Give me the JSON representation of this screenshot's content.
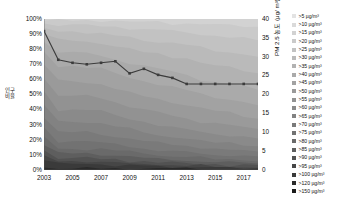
{
  "chart_data": {
    "type": "area",
    "title": "",
    "subtitle": "",
    "xlabel": "",
    "ylabel": "인구 비율",
    "ylabel_right": "PM 2.5 농도 (μg/ m³)",
    "x": [
      2003,
      2004,
      2005,
      2006,
      2007,
      2008,
      2009,
      2010,
      2011,
      2012,
      2013,
      2014,
      2015,
      2016,
      2017,
      2018
    ],
    "xlim": [
      2003,
      2018
    ],
    "ylim": [
      0,
      100
    ],
    "ylim_right": [
      0,
      40
    ],
    "yticks": [
      "0%",
      "10%",
      "20%",
      "30%",
      "40%",
      "50%",
      "60%",
      "70%",
      "80%",
      "90%",
      "100%"
    ],
    "ytick_values": [
      0,
      10,
      20,
      30,
      40,
      50,
      60,
      70,
      80,
      90,
      100
    ],
    "yticks_right": [
      "0",
      "5",
      "10",
      "15",
      "20",
      "25",
      "30",
      "35",
      "40"
    ],
    "ytick_values_right": [
      0,
      5,
      10,
      15,
      20,
      25,
      30,
      35,
      40
    ],
    "xticks": [
      "2003",
      "2005",
      "2007",
      "2009",
      "2011",
      "2013",
      "2015",
      "2017"
    ],
    "xtick_values": [
      2003,
      2005,
      2007,
      2009,
      2011,
      2013,
      2015,
      2017
    ],
    "grid": false,
    "legend_position": "right",
    "legend_title": "PM 2.5 농도 (μg/ m³)",
    "series": [
      {
        "name": ">5 µg/m³",
        "color": "#e3e3e3",
        "values": [
          100,
          100,
          100,
          100,
          100,
          100,
          100,
          100,
          100,
          100,
          100,
          100,
          100,
          100,
          100,
          100
        ]
      },
      {
        "name": ">10 µg/m³",
        "color": "#dadada",
        "values": [
          100,
          100,
          100,
          100,
          100,
          100,
          100,
          100,
          100,
          100,
          100,
          100,
          100,
          100,
          100,
          100
        ]
      },
      {
        "name": ">15 µg/m³",
        "color": "#d2d2d2",
        "values": [
          100,
          100,
          100,
          100,
          100,
          100,
          100,
          100,
          100,
          100,
          100,
          100,
          100,
          100,
          100,
          100
        ]
      },
      {
        "name": ">20 µg/m³",
        "color": "#cacaca",
        "values": [
          99,
          99,
          99,
          99,
          99,
          99,
          98,
          98,
          98,
          97,
          97,
          97,
          96,
          96,
          95,
          95
        ]
      },
      {
        "name": ">25 µg/m³",
        "color": "#c2c2c2",
        "values": [
          97,
          96,
          96,
          96,
          95,
          95,
          94,
          93,
          93,
          92,
          91,
          90,
          89,
          88,
          87,
          86
        ]
      },
      {
        "name": ">30 µg/m³",
        "color": "#bababa",
        "values": [
          94,
          92,
          92,
          91,
          90,
          89,
          88,
          86,
          85,
          84,
          83,
          81,
          79,
          78,
          77,
          75
        ]
      },
      {
        "name": ">35 µg/m³",
        "color": "#b2b2b2",
        "values": [
          90,
          86,
          86,
          85,
          84,
          82,
          80,
          78,
          77,
          75,
          74,
          71,
          69,
          68,
          66,
          64
        ]
      },
      {
        "name": ">40 µg/m³",
        "color": "#aaaaaa",
        "values": [
          85,
          78,
          78,
          77,
          76,
          73,
          71,
          69,
          67,
          65,
          63,
          60,
          58,
          57,
          55,
          53
        ]
      },
      {
        "name": ">45 µg/m³",
        "color": "#a2a2a2",
        "values": [
          78,
          69,
          69,
          68,
          67,
          64,
          61,
          59,
          57,
          55,
          53,
          50,
          48,
          47,
          45,
          43
        ]
      },
      {
        "name": ">50 µg/m³",
        "color": "#9a9a9a",
        "values": [
          70,
          59,
          59,
          58,
          57,
          54,
          51,
          49,
          47,
          45,
          43,
          41,
          39,
          38,
          36,
          34
        ]
      },
      {
        "name": ">55 µg/m³",
        "color": "#929292",
        "values": [
          61,
          49,
          49,
          49,
          48,
          45,
          42,
          40,
          38,
          36,
          34,
          32,
          31,
          30,
          28,
          27
        ]
      },
      {
        "name": ">60 µg/m³",
        "color": "#8a8a8a",
        "values": [
          52,
          40,
          40,
          40,
          39,
          36,
          34,
          32,
          30,
          28,
          27,
          25,
          24,
          23,
          22,
          21
        ]
      },
      {
        "name": ">65 µg/m³",
        "color": "#828282",
        "values": [
          43,
          32,
          32,
          32,
          31,
          29,
          27,
          25,
          23,
          22,
          21,
          19,
          18,
          18,
          17,
          16
        ]
      },
      {
        "name": ">70 µg/m³",
        "color": "#7a7a7a",
        "values": [
          35,
          25,
          25,
          25,
          24,
          22,
          21,
          19,
          18,
          17,
          16,
          15,
          14,
          13,
          13,
          12
        ]
      },
      {
        "name": ">75 µg/m³",
        "color": "#727272",
        "values": [
          28,
          19,
          19,
          19,
          18,
          17,
          16,
          14,
          13,
          12,
          12,
          11,
          10,
          10,
          9,
          9
        ]
      },
      {
        "name": ">80 µg/m³",
        "color": "#6a6a6a",
        "values": [
          22,
          14,
          14,
          14,
          14,
          13,
          12,
          11,
          10,
          9,
          9,
          8,
          7,
          7,
          7,
          6
        ]
      },
      {
        "name": ">85 µg/m³",
        "color": "#5e5e5e",
        "values": [
          17,
          11,
          11,
          11,
          10,
          10,
          9,
          8,
          7,
          7,
          6,
          6,
          5,
          5,
          5,
          4
        ]
      },
      {
        "name": ">90 µg/m³",
        "color": "#525252",
        "values": [
          13,
          8,
          8,
          8,
          7,
          7,
          6,
          6,
          5,
          5,
          4,
          4,
          4,
          3,
          3,
          3
        ]
      },
      {
        "name": ">95 µg/m³",
        "color": "#464646",
        "values": [
          9,
          6,
          6,
          6,
          5,
          5,
          4,
          4,
          4,
          3,
          3,
          3,
          2,
          2,
          2,
          2
        ]
      },
      {
        "name": ">100 µg/m³",
        "color": "#3a3a3a",
        "values": [
          7,
          4,
          4,
          4,
          4,
          3,
          3,
          3,
          2,
          2,
          2,
          2,
          2,
          1,
          1,
          1
        ]
      },
      {
        "name": ">120 µg/m³",
        "color": "#2a2a2a",
        "values": [
          2,
          1,
          1,
          1,
          1,
          1,
          1,
          1,
          1,
          1,
          1,
          1,
          0,
          0,
          0,
          0
        ]
      },
      {
        "name": ">150 µg/m³",
        "color": "#1a1a1a",
        "values": [
          0,
          0,
          0,
          0,
          0,
          0,
          0,
          0,
          0,
          0,
          0,
          0,
          0,
          0,
          0,
          0
        ]
      }
    ],
    "line_series": {
      "name": "PM 2.5 농도",
      "color": "#3b3b3b",
      "axis": "right",
      "unit": "µg/m³",
      "values_percent": [
        92,
        73,
        71,
        70,
        71,
        72,
        64,
        67,
        63,
        61,
        57,
        57,
        57,
        57,
        57,
        57
      ],
      "values": [
        36.8,
        29.2,
        28.4,
        28.0,
        28.4,
        28.8,
        25.6,
        26.8,
        25.2,
        24.4,
        22.8,
        22.8,
        22.8,
        22.8,
        22.8,
        22.8
      ]
    }
  }
}
